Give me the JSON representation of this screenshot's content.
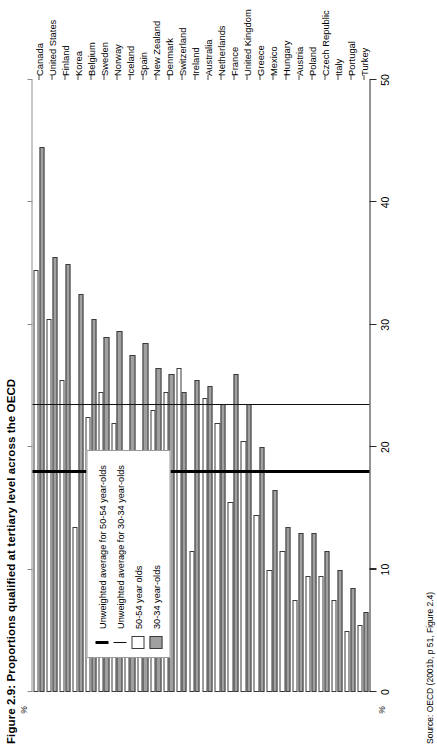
{
  "figure": {
    "title": "Figure 2.9: Proportions qualified at tertiary level across the OECD",
    "source": "Source: OECD (2001b, p 51, Figure 2.4)",
    "axis_unit_label": "%"
  },
  "legend": {
    "items": [
      {
        "key": "avg-50-54",
        "marker": "thick-line",
        "label": "Unweighted average for 50-54 year-olds"
      },
      {
        "key": "avg-30-34",
        "marker": "thin-line",
        "label": "Unweighted average for 30-34 year-olds"
      },
      {
        "key": "bar-50-54",
        "marker": "white-box",
        "label": "50-54 year olds"
      },
      {
        "key": "bar-30-34",
        "marker": "grey-box",
        "label": "30-34 year-olds"
      }
    ]
  },
  "colors": {
    "older_fill": "#ffffff",
    "younger_fill": "#a0a0a0",
    "bar_outline": "#3b3b3b",
    "avg_older_line": "#111111",
    "avg_younger_line": "#000000",
    "axis": "#2b2b2b"
  },
  "chart_data": {
    "type": "bar",
    "orientation": "horizontal",
    "title": "Figure 2.9: Proportions qualified at tertiary level across the OECD",
    "xlabel": "%",
    "ylabel": "",
    "xlim": [
      0,
      50
    ],
    "xticks": [
      0,
      10,
      20,
      30,
      40,
      50
    ],
    "grid": false,
    "legend_position": "inside-left",
    "categories": [
      "Canada",
      "United States",
      "Finland",
      "Korea",
      "Belgium",
      "Sweden",
      "Norway",
      "Iceland",
      "Spain",
      "New Zealand",
      "Denmark",
      "Switzerland",
      "Ireland",
      "Australia",
      "Netherlands",
      "France",
      "United Kingdom",
      "Greece",
      "Mexico",
      "Hungary",
      "Austria",
      "Poland",
      "Czech Republic",
      "Italy",
      "Portugal",
      "Turkey"
    ],
    "series": [
      {
        "name": "50-54 year olds",
        "values": [
          34.5,
          30.5,
          25.5,
          13.5,
          22.5,
          24.5,
          22.0,
          18.0,
          13.5,
          23.0,
          24.5,
          26.5,
          11.5,
          24.0,
          22.0,
          15.5,
          20.5,
          14.5,
          10.0,
          11.5,
          7.5,
          9.5,
          9.5,
          7.5,
          5.0,
          5.5
        ]
      },
      {
        "name": "30-34 year-olds",
        "values": [
          44.5,
          35.5,
          35.0,
          32.5,
          30.5,
          29.0,
          29.5,
          27.5,
          28.5,
          26.5,
          26.0,
          24.5,
          25.5,
          25.0,
          23.5,
          26.0,
          23.5,
          20.0,
          16.5,
          13.5,
          13.0,
          13.0,
          11.5,
          10.0,
          8.5,
          6.5
        ]
      }
    ],
    "reference_lines": [
      {
        "name": "Unweighted average for 50-54 year-olds",
        "value": 18.0,
        "style": "thick"
      },
      {
        "name": "Unweighted average for 30-34 year-olds",
        "value": 23.5,
        "style": "thin"
      }
    ]
  }
}
